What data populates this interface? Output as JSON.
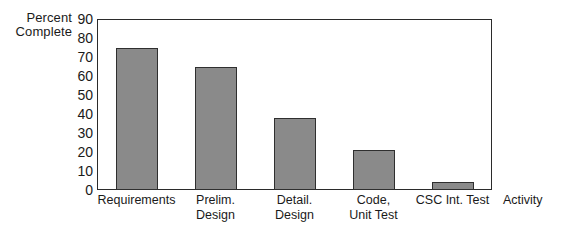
{
  "chart_data": {
    "type": "bar",
    "title": "",
    "categories": [
      "Requirements",
      "Prelim.\nDesign",
      "Detail.\nDesign",
      "Code,\nUnit Test",
      "CSC Int. Test"
    ],
    "values": [
      75,
      65,
      38,
      21,
      4
    ],
    "xlabel": "Activity",
    "ylabel": "Percent\nComplete",
    "ylim": [
      0,
      90
    ],
    "yticks": [
      90,
      80,
      70,
      60,
      50,
      40,
      30,
      20,
      10,
      0
    ],
    "grid": false,
    "legend": false,
    "bar_color": "#8a8a8a",
    "bar_border_color": "#2f2f2f",
    "axis_color": "#2b2b2b",
    "background_color": "#ffffff"
  }
}
